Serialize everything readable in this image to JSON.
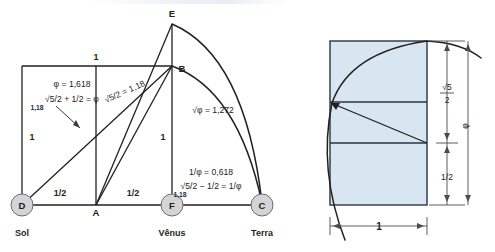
{
  "figure": {
    "left_diagram": {
      "nodes": [
        {
          "id": "D",
          "label": "D",
          "planet": "Sol"
        },
        {
          "id": "A",
          "label": "A",
          "planet": ""
        },
        {
          "id": "F",
          "label": "F",
          "planet": "Vênus"
        },
        {
          "id": "C",
          "label": "C",
          "planet": "Terra"
        },
        {
          "id": "B",
          "label": "B",
          "planet": ""
        },
        {
          "id": "E",
          "label": "E",
          "planet": ""
        }
      ],
      "segment_labels": {
        "top_one": "1",
        "left_one": "1",
        "mid_one": "1",
        "half_left": "1/2",
        "half_right": "1/2"
      },
      "annotations": {
        "phi_value": "φ = 1,618",
        "phi_formula": "√5/2 + 1/2 = φ",
        "phi_formula_sub": "1,18",
        "root5_half": "√5/2 = 1,18",
        "sqrt_phi": "√φ = 1,272",
        "inv_phi_value": "1/φ = 0,618",
        "inv_phi_formula": "√5/2 − 1/2 = 1/φ",
        "inv_phi_formula_sub": "1,18"
      }
    },
    "right_diagram": {
      "dimensions": {
        "root5_over_2_num": "√5",
        "root5_over_2_den": "2",
        "phi": "φ",
        "half": "1/2",
        "width_one": "1"
      }
    },
    "colors": {
      "rect_fill": "#d8e6f2",
      "rect_stroke": "#2b3440",
      "line": "#231f20",
      "node_fill": "#d4d4d6",
      "annotation_accent": "#1a2a4a"
    }
  }
}
